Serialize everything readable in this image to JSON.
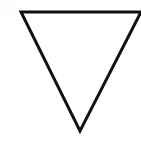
{
  "canvas": {
    "width": 141,
    "height": 147,
    "background_color": "#ffffff",
    "description": "Blank white canvas containing a single line-drawn geometric figure"
  },
  "figure": {
    "name": "inverted-triangle",
    "label": "Downward-pointing triangle outline",
    "shape_type": "triangle",
    "orientation": "point-down",
    "filled": false,
    "stroke_color": "#111111",
    "stroke_width": 3,
    "fill_color": "none",
    "vertices": [
      {
        "name": "top-left-vertex",
        "x": 21,
        "y": 12
      },
      {
        "name": "top-right-vertex",
        "x": 141,
        "y": 12
      },
      {
        "name": "bottom-apex-vertex",
        "x": 80,
        "y": 131
      }
    ],
    "points_attr": "21,12 141,12 80,131"
  },
  "artifacts": {
    "corner_noise": {
      "name": "top-left-compression-noise",
      "visible": false,
      "color": "#fdfdfd"
    }
  }
}
